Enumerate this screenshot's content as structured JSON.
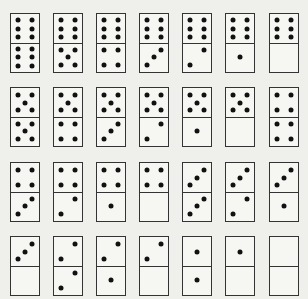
{
  "style": {
    "background": "#efefec",
    "face": "#f6f6f3",
    "border": "#333333",
    "pip": "#111111"
  },
  "layout": {
    "columns_x": [
      10,
      53,
      96,
      139,
      182,
      225,
      269
    ],
    "rows_y": [
      13,
      87,
      162,
      236
    ]
  },
  "rows": [
    {
      "dominoes": [
        {
          "top": 6,
          "bottom": 6
        },
        {
          "top": 6,
          "bottom": 5
        },
        {
          "top": 6,
          "bottom": 4
        },
        {
          "top": 6,
          "bottom": 3
        },
        {
          "top": 6,
          "bottom": 2
        },
        {
          "top": 6,
          "bottom": 1
        },
        {
          "top": 6,
          "bottom": 0
        }
      ]
    },
    {
      "dominoes": [
        {
          "top": 5,
          "bottom": 5
        },
        {
          "top": 5,
          "bottom": 4
        },
        {
          "top": 5,
          "bottom": 3
        },
        {
          "top": 5,
          "bottom": 2
        },
        {
          "top": 5,
          "bottom": 1
        },
        {
          "top": 5,
          "bottom": 0
        },
        {
          "top": 4,
          "bottom": 4
        }
      ]
    },
    {
      "dominoes": [
        {
          "top": 4,
          "bottom": 3
        },
        {
          "top": 4,
          "bottom": 2
        },
        {
          "top": 4,
          "bottom": 1
        },
        {
          "top": 4,
          "bottom": 0
        },
        {
          "top": 3,
          "bottom": 3
        },
        {
          "top": 3,
          "bottom": 2
        },
        {
          "top": 3,
          "bottom": 1
        }
      ]
    },
    {
      "dominoes": [
        {
          "top": 3,
          "bottom": 0
        },
        {
          "top": 2,
          "bottom": 2
        },
        {
          "top": 2,
          "bottom": 1
        },
        {
          "top": 2,
          "bottom": 0
        },
        {
          "top": 1,
          "bottom": 1
        },
        {
          "top": 1,
          "bottom": 0
        },
        {
          "top": 0,
          "bottom": 0
        }
      ]
    }
  ]
}
